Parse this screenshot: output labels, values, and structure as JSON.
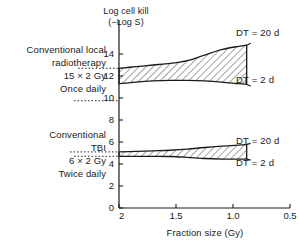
{
  "chart_data": {
    "type": "area",
    "title": "",
    "xlabel": "Fraction size (Gy)",
    "ylabel": "Log cell kill\n(−Log S)",
    "xlim": [
      2.0,
      0.5
    ],
    "ylim": [
      0,
      15
    ],
    "x_ticks": [
      "2",
      "1.5",
      "1.0",
      "0.5"
    ],
    "x_tick_values": [
      2.0,
      1.5,
      1.0,
      0.5
    ],
    "y_ticks": [
      "0",
      "2",
      "4",
      "6",
      "8",
      "10",
      "12",
      "14"
    ],
    "y_tick_values": [
      0,
      2,
      4,
      6,
      8,
      10,
      12,
      14
    ],
    "grid": false,
    "legend_position": "right-inline",
    "bands": [
      {
        "name": "Conventional local radiotherapy",
        "x": [
          2.0,
          1.85,
          1.7,
          1.55,
          1.4,
          1.25,
          1.1,
          0.95,
          0.88
        ],
        "upper_values": [
          12.7,
          12.85,
          13.0,
          13.15,
          13.4,
          13.9,
          14.4,
          14.7,
          14.8
        ],
        "lower_values": [
          11.3,
          11.45,
          11.55,
          11.6,
          11.6,
          11.55,
          11.45,
          11.3,
          11.25
        ],
        "upper_label": "DT = 20 d",
        "lower_label": "DT = 2 d"
      },
      {
        "name": "Conventional TBI",
        "x": [
          2.0,
          1.85,
          1.7,
          1.55,
          1.4,
          1.25,
          1.1,
          0.95,
          0.88
        ],
        "upper_values": [
          5.1,
          5.15,
          5.2,
          5.25,
          5.35,
          5.5,
          5.62,
          5.72,
          5.78
        ],
        "lower_values": [
          4.7,
          4.7,
          4.7,
          4.68,
          4.6,
          4.5,
          4.45,
          4.45,
          4.45
        ],
        "upper_label": "DT = 20 d",
        "lower_label": "DT = 2 d"
      }
    ]
  },
  "axis": {
    "y_title": "Log cell kill\n(−Log S)",
    "x_title": "Fraction size (Gy)",
    "y_ticks": [
      "0",
      "2",
      "4",
      "6",
      "8",
      "10",
      "12",
      "14"
    ],
    "x_ticks": [
      "2",
      "1.5",
      "1.0",
      "0.5"
    ]
  },
  "annotations": {
    "top_block": "Conventional local\nradiotherapy\n15 × 2 Gy\nOnce daily",
    "bottom_block": "Conventional\nTBI\n6 × 2 Gy\nTwice daily"
  },
  "series_labels": {
    "top_upper": "DT = 20 d",
    "top_lower": "DT = 2 d",
    "bottom_upper": "DT = 20 d",
    "bottom_lower": "DT = 2 d"
  },
  "colors": {
    "ink": "#1a1a1a",
    "background": "#ffffff",
    "hatch": "#555555"
  }
}
